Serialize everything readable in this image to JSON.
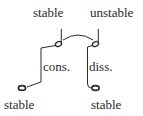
{
  "diagram": {
    "top_left_label": "stable",
    "top_right_label": "unstable",
    "left_interval_label": "cons.",
    "right_interval_label": "diss.",
    "bottom_left_label": "stable",
    "bottom_right_label": "stable"
  },
  "colors": {
    "ink": "#2a2a2a",
    "background": "#ffffff"
  }
}
